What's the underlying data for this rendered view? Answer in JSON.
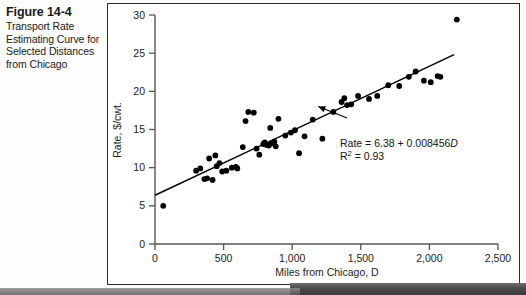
{
  "caption": {
    "figure_number": "Figure 14-4",
    "title": "Transport Rate Estimating Curve for Selected Distances from Chicago"
  },
  "chart_data": {
    "type": "scatter",
    "title": "",
    "xlabel": "Miles from Chicago, D",
    "ylabel": "Rate, $/cwt.",
    "xlim": [
      0,
      2500
    ],
    "ylim": [
      0,
      30
    ],
    "xticks": [
      0,
      500,
      1000,
      1500,
      2000,
      2500
    ],
    "xtick_labels": [
      "0",
      "500",
      "1,000",
      "1,500",
      "2,000",
      "2,500"
    ],
    "yticks": [
      0,
      5,
      10,
      15,
      20,
      25,
      30
    ],
    "ytick_labels": [
      "0",
      "5",
      "10",
      "15",
      "20",
      "25",
      "30"
    ],
    "grid": false,
    "legend": null,
    "series": [
      {
        "name": "Observed rates",
        "marker": "filled-circle",
        "color": "#000000",
        "points": [
          [
            60,
            5.0
          ],
          [
            300,
            9.6
          ],
          [
            330,
            9.9
          ],
          [
            360,
            8.5
          ],
          [
            380,
            8.6
          ],
          [
            395,
            11.2
          ],
          [
            420,
            8.4
          ],
          [
            440,
            11.6
          ],
          [
            450,
            10.2
          ],
          [
            470,
            10.6
          ],
          [
            490,
            9.5
          ],
          [
            520,
            9.6
          ],
          [
            560,
            10.0
          ],
          [
            590,
            10.1
          ],
          [
            600,
            9.9
          ],
          [
            640,
            12.7
          ],
          [
            660,
            16.1
          ],
          [
            680,
            17.3
          ],
          [
            720,
            17.2
          ],
          [
            740,
            12.5
          ],
          [
            760,
            11.7
          ],
          [
            790,
            13.1
          ],
          [
            800,
            13.3
          ],
          [
            810,
            13.0
          ],
          [
            830,
            12.9
          ],
          [
            840,
            15.2
          ],
          [
            850,
            13.2
          ],
          [
            870,
            13.4
          ],
          [
            880,
            12.8
          ],
          [
            900,
            16.4
          ],
          [
            950,
            14.2
          ],
          [
            990,
            14.6
          ],
          [
            1020,
            14.9
          ],
          [
            1050,
            11.9
          ],
          [
            1090,
            14.1
          ],
          [
            1150,
            16.3
          ],
          [
            1220,
            13.8
          ],
          [
            1300,
            17.3
          ],
          [
            1360,
            18.6
          ],
          [
            1380,
            19.1
          ],
          [
            1400,
            18.2
          ],
          [
            1430,
            18.3
          ],
          [
            1480,
            19.4
          ],
          [
            1560,
            19.0
          ],
          [
            1620,
            19.4
          ],
          [
            1700,
            20.8
          ],
          [
            1780,
            20.7
          ],
          [
            1850,
            21.9
          ],
          [
            1900,
            22.6
          ],
          [
            1960,
            21.4
          ],
          [
            2010,
            21.2
          ],
          [
            2060,
            22.0
          ],
          [
            2080,
            21.9
          ],
          [
            2200,
            29.4
          ]
        ]
      }
    ],
    "fit_line": {
      "name": "Regression line",
      "type": "line",
      "color": "#000000",
      "intercept": 6.38,
      "slope": 0.008456,
      "x_start": 0,
      "x_end": 2180
    },
    "annotations": [
      {
        "name": "regression-equation",
        "lines": [
          "Rate = 6.38 + 0.008456D",
          "R2 = 0.93"
        ],
        "equation_prefix": "Rate = 6.38 + 0.008456",
        "equation_variable": "D",
        "r_squared_label": "R",
        "r_squared_exponent": "2",
        "r_squared_value": " = 0.93",
        "pointer_from": [
          1400,
          16.5
        ],
        "pointer_to": [
          1190,
          18.0
        ]
      }
    ]
  }
}
